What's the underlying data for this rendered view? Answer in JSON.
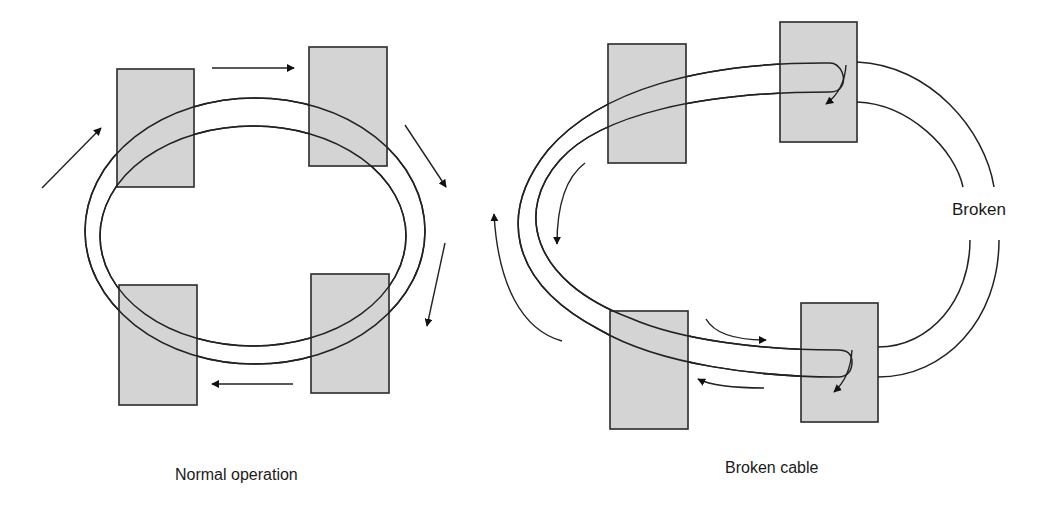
{
  "diagrams": [
    {
      "id": "normal",
      "caption": "Normal operation",
      "nodes": 4
    },
    {
      "id": "broken",
      "caption": "Broken cable",
      "break_label": "Broken",
      "nodes": 4
    }
  ],
  "colors": {
    "node_fill": "#d4d4d4",
    "stroke": "#222222",
    "background": "#ffffff"
  }
}
